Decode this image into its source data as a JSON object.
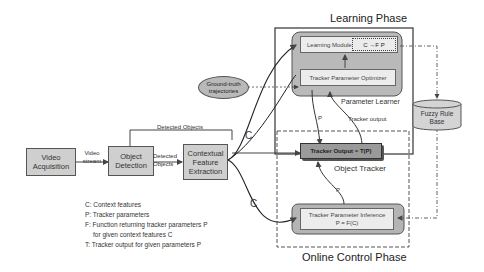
{
  "phases": {
    "learning": "Learning Phase",
    "online": "Online Control Phase"
  },
  "nodes": {
    "video_acquisition": "Video Acquisition",
    "object_detection": "Object Detection",
    "contextual_feature_extraction": "Contextual Feature Extraction",
    "ground_truth": "Ground-truth trajectories",
    "learning_module": "Learning Module",
    "learning_function": "C →F P",
    "tracker_parameter_optimizer": "Tracker Parameter Optimizer",
    "parameter_learner": "Parameter Learner",
    "tracker_output": "Tracker Output = T(P)",
    "object_tracker": "Object Tracker",
    "tracker_parameter_inference": "Tracker Parameter Inference",
    "inference_formula": "P = F(C)",
    "fuzzy_rule_base": "Fuzzy Rule Base"
  },
  "edge_labels": {
    "video_stream": "Video stream",
    "detected_objects_top": "Detected Objects",
    "detected_objects_mid": "Detected Objects",
    "c_upper": "C",
    "c_lower": "C",
    "p_learner": "P",
    "tracker_output_feedback": "Tracker output",
    "p_inference": "P"
  },
  "legend": [
    "C: Context features",
    "P: Tracker parameters",
    "F: Function returning tracker parameters P",
    "   for given context features C",
    "T: Tracker output for given parameters P"
  ]
}
